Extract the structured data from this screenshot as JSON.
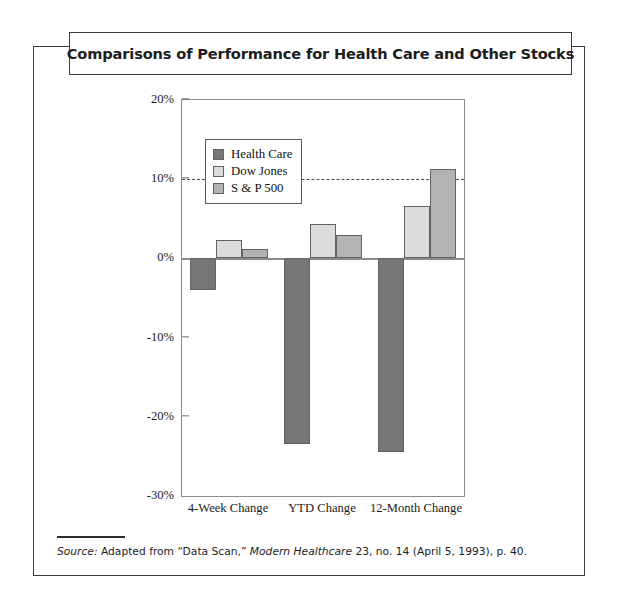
{
  "figure": {
    "title": "Comparisons of Performance for Health Care and Other Stocks",
    "source_prefix": "Source:",
    "source_text_1": " Adapted from “Data Scan,” ",
    "source_italic_2": "Modern Healthcare",
    "source_text_3": " 23, no. 14 (April 5, 1993), p. 40."
  },
  "colors": {
    "health_care": "#767676",
    "dow_jones": "#dcdcdc",
    "sp_500": "#b3b3b3",
    "frame": "#3a3a3a",
    "axis": "#8c8c8c"
  },
  "chart_data": {
    "type": "bar",
    "title": "Comparisons of Performance for Health Care and Other Stocks",
    "xlabel": "",
    "ylabel": "",
    "categories": [
      "4-Week Change",
      "YTD Change",
      "12-Month Change"
    ],
    "series": [
      {
        "name": "Health Care",
        "values": [
          -4.0,
          -23.4,
          -24.4
        ]
      },
      {
        "name": "Dow Jones",
        "values": [
          2.3,
          4.4,
          6.6
        ]
      },
      {
        "name": "S & P 500",
        "values": [
          1.2,
          2.9,
          11.3
        ]
      }
    ],
    "ylim": [
      -30,
      20
    ],
    "ytick_values": [
      20,
      10,
      0,
      -10,
      -20,
      -30
    ],
    "ytick_labels": [
      "20%",
      "10%",
      "0%",
      "-10%",
      "-20%",
      "-30%"
    ],
    "grid": false,
    "reference_line": {
      "value": 10,
      "style": "dashed"
    },
    "legend_position": "upper-left",
    "legend": [
      "Health Care",
      "Dow Jones",
      "S & P 500"
    ]
  }
}
